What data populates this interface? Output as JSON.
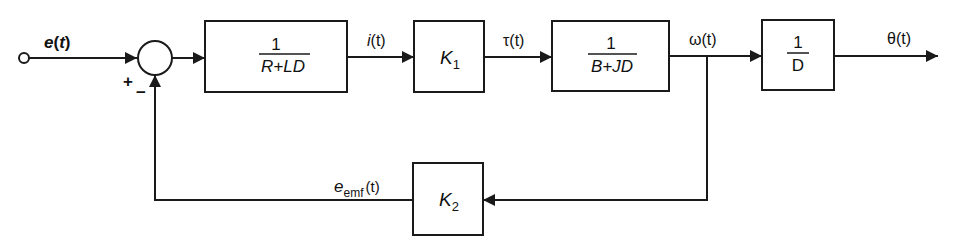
{
  "diagram": {
    "type": "block-diagram",
    "title": "",
    "stroke_color": "#1a1a1a",
    "background": "#ffffff",
    "input": {
      "signal": "e(t)",
      "name": "e",
      "arg": "t"
    },
    "summing_junction": {
      "plus_sign": "+",
      "minus_sign": "−"
    },
    "blocks": [
      {
        "id": "electrical",
        "numerator": "1",
        "denominator": "R+LD"
      },
      {
        "id": "torque-constant",
        "label": "K",
        "subscript": "1"
      },
      {
        "id": "mechanical",
        "numerator": "1",
        "denominator": "B+JD"
      },
      {
        "id": "integrator",
        "numerator": "1",
        "denominator": "D"
      },
      {
        "id": "back-emf-constant",
        "label": "K",
        "subscript": "2"
      }
    ],
    "signals": {
      "current": {
        "name": "i",
        "arg": "(t)"
      },
      "torque": {
        "name": "τ",
        "arg": "(t)"
      },
      "speed": {
        "name": "ω",
        "arg": "(t)"
      },
      "angle": {
        "name": "θ",
        "arg": "(t)"
      },
      "back_emf": {
        "name": "e",
        "subscript": "emf",
        "arg": "(t)"
      }
    },
    "input_label": {
      "name": "e",
      "arg": "(t)"
    }
  }
}
